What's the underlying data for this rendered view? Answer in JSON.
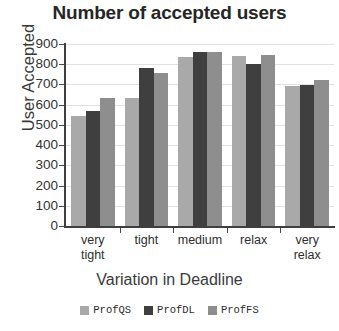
{
  "chart_data": {
    "type": "bar",
    "title": "Number of accepted users",
    "xlabel": "Variation in Deadline",
    "ylabel": "User Accepted",
    "categories": [
      "very tight",
      "tight",
      "medium",
      "relax",
      "very relax"
    ],
    "category_lines": [
      [
        "very",
        "tight"
      ],
      [
        "tight",
        ""
      ],
      [
        "medium",
        ""
      ],
      [
        "relax",
        ""
      ],
      [
        "very",
        "relax"
      ]
    ],
    "series": [
      {
        "name": "ProfQS",
        "color": "#a9a9a9",
        "values": [
          545,
          635,
          835,
          840,
          690
        ]
      },
      {
        "name": "ProfDL",
        "color": "#3f3f3f",
        "values": [
          570,
          780,
          860,
          800,
          695
        ]
      },
      {
        "name": "ProfFS",
        "color": "#8e8e8e",
        "values": [
          635,
          755,
          860,
          845,
          720
        ]
      }
    ],
    "ylim": [
      0,
      900
    ],
    "ytick_values": [
      0,
      100,
      200,
      300,
      400,
      500,
      600,
      700,
      800,
      900
    ],
    "ytick_labels": [
      "0",
      "100",
      "200",
      "300",
      "400",
      "500",
      "600",
      "700",
      "800",
      "900"
    ],
    "grid": "horizontal",
    "legend_position": "bottom"
  }
}
